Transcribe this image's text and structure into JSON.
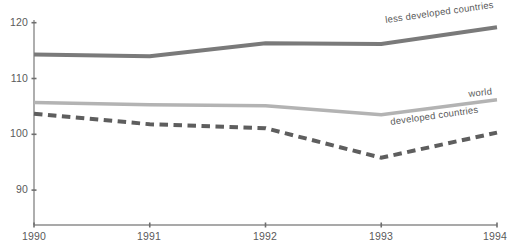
{
  "chart_data": {
    "type": "line",
    "title": "",
    "subtitle": "",
    "xlabel": "",
    "ylabel": "",
    "x": [
      1990,
      1991,
      1992,
      1993,
      1994
    ],
    "xtick_labels": [
      "1990",
      "1991",
      "1992",
      "1993",
      "1994"
    ],
    "ytick_labels": [
      "120",
      "110",
      "100",
      "90"
    ],
    "yticks": [
      120,
      110,
      100,
      90
    ],
    "xlim": [
      1990,
      1994
    ],
    "ylim": [
      85.5,
      121.5
    ],
    "grid": false,
    "legend_position": "inline-right",
    "series": [
      {
        "name": "less developed countries",
        "values": [
          114.3,
          114.0,
          116.3,
          116.2,
          119.2
        ],
        "color": "#7a7a7a",
        "style": "solid",
        "width": 4
      },
      {
        "name": "world",
        "values": [
          105.7,
          105.3,
          105.1,
          103.5,
          106.2
        ],
        "color": "#b3b3b3",
        "style": "solid",
        "width": 3.5
      },
      {
        "name": "developed countries",
        "values": [
          103.7,
          101.8,
          101.1,
          95.8,
          100.3
        ],
        "color": "#5e5e5e",
        "style": "dashed",
        "width": 4
      }
    ],
    "annotations": [
      {
        "text": "less developed countries",
        "series": "less developed countries"
      },
      {
        "text": "world",
        "series": "world"
      },
      {
        "text": "developed countries",
        "series": "developed countries"
      }
    ]
  },
  "axis": {
    "line_color": "#8c8c8c",
    "tick_color": "#6e6e6e",
    "text_color": "#5a5a5a"
  }
}
